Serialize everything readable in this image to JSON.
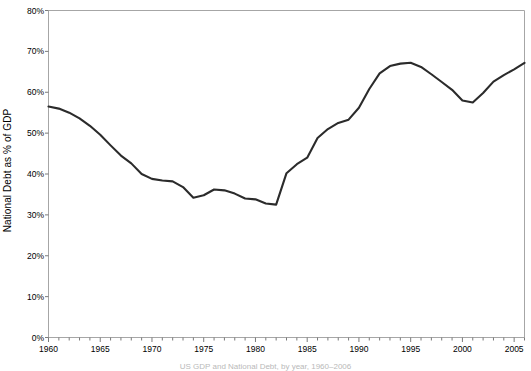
{
  "chart_data": {
    "type": "line",
    "title": "",
    "subtitle": "",
    "xlabel": "",
    "ylabel": "National Debt as % of GDP",
    "xlim": [
      1960,
      2006
    ],
    "ylim": [
      0,
      80
    ],
    "grid": false,
    "legend": null,
    "legend_position": "none",
    "y_tick_labels": [
      "80%",
      "70%",
      "60%",
      "50%",
      "40%",
      "30%",
      "20%",
      "10%",
      "0%"
    ],
    "y_tick_values": [
      80,
      70,
      60,
      50,
      40,
      30,
      20,
      10,
      0
    ],
    "x_tick_labels": [
      "1960",
      "1965",
      "1970",
      "1975",
      "1980",
      "1985",
      "1990",
      "1995",
      "2000",
      "2005"
    ],
    "x_tick_values": [
      1960,
      1965,
      1970,
      1975,
      1980,
      1985,
      1990,
      1995,
      2000,
      2005
    ],
    "x_minor_tick_step": 1,
    "series": [
      {
        "name": "National Debt as % of GDP",
        "color": "#2b2b2b",
        "line_width": 2.1,
        "x": [
          1960,
          1961,
          1962,
          1963,
          1964,
          1965,
          1966,
          1967,
          1968,
          1969,
          1970,
          1971,
          1972,
          1973,
          1974,
          1975,
          1976,
          1977,
          1978,
          1979,
          1980,
          1981,
          1982,
          1983,
          1984,
          1985,
          1986,
          1987,
          1988,
          1989,
          1990,
          1991,
          1992,
          1993,
          1994,
          1995,
          1996,
          1997,
          1998,
          1999,
          2000,
          2001,
          2002,
          2003,
          2004,
          2005,
          2006
        ],
        "y": [
          56.5,
          56.0,
          55.0,
          53.6,
          51.8,
          49.6,
          47.0,
          44.5,
          42.6,
          40.0,
          38.8,
          38.4,
          38.2,
          36.8,
          34.2,
          34.8,
          36.2,
          36.0,
          35.2,
          34.0,
          33.8,
          32.8,
          32.5,
          40.2,
          42.4,
          44.0,
          48.8,
          51.0,
          52.5,
          53.3,
          56.2,
          60.8,
          64.6,
          66.4,
          67.0,
          67.2,
          66.2,
          64.4,
          62.5,
          60.6,
          58.0,
          57.5,
          59.8,
          62.6,
          64.2,
          65.6,
          67.2
        ]
      }
    ],
    "annotations": [],
    "bottom_caption": "US GDP and National Debt, by year, 1960–2006"
  },
  "axes": {
    "frame_color": "#a6a6a6",
    "tick_color": "#7a7a7a",
    "background": "#ffffff"
  }
}
